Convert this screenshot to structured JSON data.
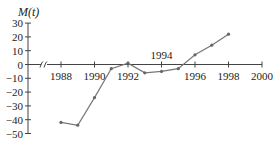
{
  "chart_data": {
    "type": "line",
    "title": "",
    "ylabel": "M(t)",
    "xlabel": "",
    "x": [
      1988,
      1989,
      1990,
      1991,
      1992,
      1993,
      1994,
      1995,
      1996,
      1997,
      1998
    ],
    "series": [
      {
        "name": "M(t)",
        "values": [
          -42,
          -44,
          -24,
          -3,
          1,
          -6,
          -5,
          -3,
          7,
          14,
          22
        ]
      }
    ],
    "xticks": [
      1988,
      1990,
      1992,
      1994,
      1996,
      1998,
      2000
    ],
    "yticks": [
      30,
      20,
      10,
      0,
      -10,
      -20,
      -30,
      -40,
      -50
    ],
    "xlim": [
      1986.5,
      2000
    ],
    "ylim": [
      -50,
      30
    ],
    "axis_break": true,
    "grid": false,
    "legend": "none",
    "colors": {
      "line": "#777777",
      "axis": "#444444"
    }
  }
}
